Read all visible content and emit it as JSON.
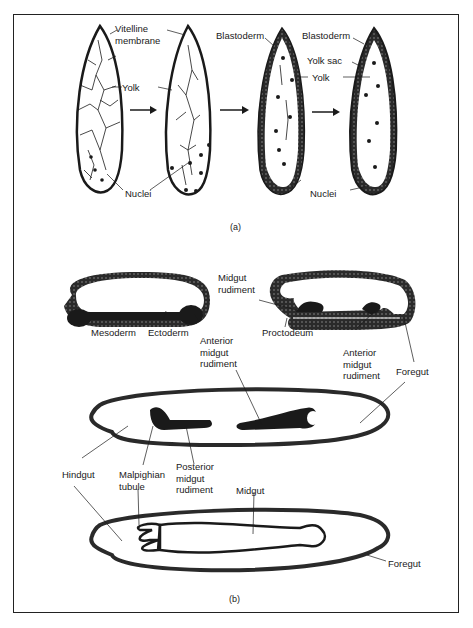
{
  "figure": {
    "panels": [
      {
        "caption": "(a)",
        "stages": 4,
        "labels": {
          "vitelline": "Vitelline\nmembrane",
          "yolk_1": "Yolk",
          "nuclei_1": "Nuclei",
          "blastoderm_1": "Blastoderm",
          "blastoderm_2": "Blastoderm",
          "yolk_sac": "Yolk sac",
          "yolk_2": "Yolk",
          "nuclei_2": "Nuclei"
        }
      },
      {
        "caption": "(b)",
        "labels": {
          "midgut_rudiment": "Midgut\nrudiment",
          "mesoderm": "Mesoderm",
          "ectoderm": "Ectoderm",
          "anterior_midgut_1": "Anterior\nmidgut\nrudiment",
          "proctodeum": "Proctodeum",
          "anterior_midgut_2": "Anterior\nmidgut\nrudiment",
          "foregut_1": "Foregut",
          "hindgut": "Hindgut",
          "malpighian": "Malpighian\ntubule",
          "posterior_midgut": "Posterior\nmidgut\nrudiment",
          "midgut": "Midgut",
          "foregut_2": "Foregut"
        }
      }
    ],
    "colors": {
      "ink": "#1a1a1a",
      "tissue": "#2a2a2a",
      "paper": "#ffffff"
    }
  }
}
